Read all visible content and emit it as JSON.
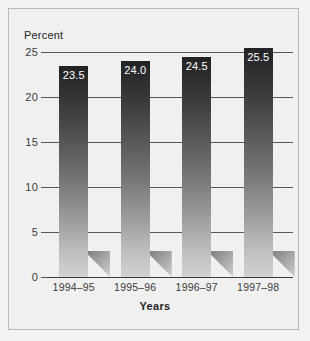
{
  "chart_data": {
    "type": "bar",
    "title": "",
    "xlabel": "Years",
    "ylabel": "Percent",
    "categories": [
      "1994–95",
      "1995–96",
      "1996–97",
      "1997–98"
    ],
    "values": [
      23.5,
      24.0,
      24.5,
      25.5
    ],
    "data_labels": [
      "23.5",
      "24.0",
      "24.5",
      "25.5"
    ],
    "ylim": [
      0,
      25
    ],
    "yticks": [
      0,
      5,
      10,
      15,
      20,
      25
    ],
    "ytick_labels": [
      "0",
      "5",
      "10",
      "15",
      "20",
      "25"
    ],
    "grid": true,
    "grid_axis": "y",
    "legend": false,
    "legend_position": "none",
    "bar_fill": "vertical-gradient-dark-to-light",
    "bar_color_top": "#232325",
    "bar_color_bottom": "#d2d2d4",
    "data_label_color": "#ffffff",
    "background_color": "#f0f0f0",
    "axis_color": "#58585a",
    "frame_color": "#b9b9bb"
  }
}
